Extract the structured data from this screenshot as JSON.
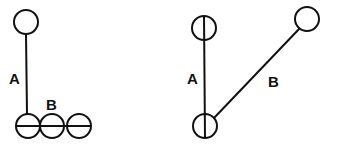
{
  "diagram_left": {
    "label_a": "A",
    "label_b": "B"
  },
  "diagram_right": {
    "label_a": "A",
    "label_b": "B"
  },
  "colors": {
    "stroke": "#111111",
    "background": "#ffffff"
  }
}
